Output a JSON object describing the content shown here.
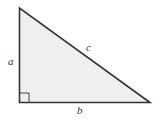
{
  "diagram": {
    "fill_color": "#efefef",
    "stroke_color": "#333333",
    "vertices": {
      "top": [
        19.5,
        8
      ],
      "right_angle": [
        19.5,
        102.5
      ],
      "right": [
        150,
        102.5
      ]
    },
    "labels": {
      "a": "a",
      "b": "b",
      "c": "c"
    },
    "right_angle_marker": true
  }
}
